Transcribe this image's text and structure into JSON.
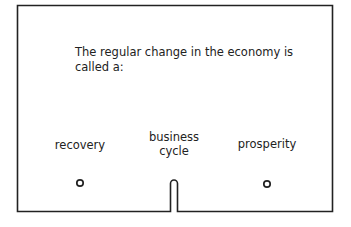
{
  "card": {
    "question": "The regular change in the economy is called a:",
    "options": [
      {
        "label": "recovery",
        "hole": "circle"
      },
      {
        "label": "business cycle",
        "line1": "business",
        "line2": "cycle",
        "hole": "slot-notch"
      },
      {
        "label": "prosperity",
        "hole": "circle"
      }
    ],
    "stroke_color": "#222222"
  }
}
